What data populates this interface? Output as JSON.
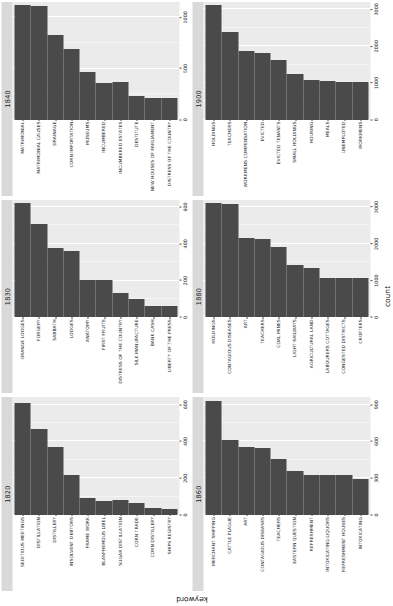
{
  "chart_data": {
    "type": "bar",
    "title": "",
    "xlabel": "count",
    "ylabel": "keyword",
    "orientation": "horizontal",
    "grid": true,
    "legend": false,
    "facet_variable": "decade",
    "panels": [
      {
        "facet_label": "1820",
        "xlim": [
          0,
          640
        ],
        "xticks": [
          0,
          200,
          400,
          600
        ],
        "xticklabels": [
          "0",
          "200",
          "400",
          "600"
        ],
        "categories": [
          "SEDITIOUS MEETINGS",
          "DISTILLATION",
          "DISTILLERY",
          "INSOLVENT DEBTORS",
          "FRAME WORK",
          "BLASPHEMOUS LIBEL",
          "SUGAR DISTILLATION",
          "CORN TRADE",
          "CORN DISTILLERY",
          "SHIPS REGISTRY"
        ],
        "values": [
          610,
          470,
          370,
          215,
          95,
          78,
          80,
          63,
          40,
          35
        ]
      },
      {
        "facet_label": "1830",
        "xlim": [
          0,
          640
        ],
        "xticks": [
          0,
          200,
          400,
          600
        ],
        "xticklabels": [
          "0",
          "200",
          "400",
          "600"
        ],
        "categories": [
          "ORANGE LODGES",
          "FORGERY",
          "SABBATH",
          "LODGES",
          "ANATOMY",
          "FIRST FRUITS",
          "DISTRESS OF THE COUNTRY",
          "SILK MANUFACTURE",
          "BANK CASH",
          "LIBERTY OF THE PRESS"
        ],
        "values": [
          620,
          505,
          375,
          360,
          205,
          205,
          130,
          100,
          62,
          60
        ]
      },
      {
        "facet_label": "1840",
        "xlim": [
          0,
          1150
        ],
        "xticks": [
          0,
          500,
          1000
        ],
        "xticklabels": [
          "0",
          "500",
          "1000"
        ],
        "categories": [
          "MATRIMONIAL",
          "MATRIMONIAL CAUSES",
          "DRAINAGE",
          "CORN IMPORTATION",
          "MUSEUMS",
          "INCUMBERED",
          "INCUMBERED ESTATES",
          "DESTITUTE",
          "NEW HOUSES OF PARLIAMENT",
          "DISTRESS OF THE COUNTRY"
        ],
        "values": [
          1120,
          1115,
          830,
          690,
          470,
          360,
          365,
          235,
          215,
          210
        ]
      },
      {
        "facet_label": "1860",
        "xlim": [
          0,
          960
        ],
        "xticks": [
          0,
          300,
          600,
          900
        ],
        "xticklabels": [
          "0",
          "300",
          "600",
          "900"
        ],
        "categories": [
          "MERCHANT SHIPPING",
          "CATTLE PLAGUE",
          "ART",
          "CONTAGIOUS DISEASES",
          "TEACHERS",
          "EASTERN QUESTION",
          "REFRESHMENT",
          "INTOXICATING LIQUORS",
          "REFRESHMENT HOUSES",
          "INTOXICATING"
        ],
        "values": [
          930,
          610,
          555,
          550,
          455,
          355,
          330,
          330,
          330,
          290
        ]
      },
      {
        "facet_label": "1880",
        "xlim": [
          0,
          3200
        ],
        "xticks": [
          0,
          1000,
          2000,
          3000
        ],
        "xticklabels": [
          "0",
          "1000",
          "2000",
          "3000"
        ],
        "categories": [
          "HOLDINGS",
          "CONTAGIOUS DISEASES",
          "ART",
          "TEACHERS",
          "COAL MINES",
          "LIGHT RAILWAYS",
          "AGRICULTURAL LAND",
          "LABOURERS COTTAGES",
          "CONGESTED DISTRICTS",
          "CROFTERS"
        ],
        "values": [
          3100,
          3090,
          2170,
          2130,
          1900,
          1430,
          1330,
          1080,
          1070,
          1060
        ]
      },
      {
        "facet_label": "1900",
        "xlim": [
          0,
          3200
        ],
        "xticks": [
          0,
          1000,
          2000,
          3000
        ],
        "xticklabels": [
          "0",
          "1000",
          "2000",
          "3000"
        ],
        "categories": [
          "HOLDINGS",
          "TEACHERS",
          "WORKMENS COMPENSATION",
          "EVICTED",
          "EVICTED TENANTS",
          "SMALL HOLDINGS",
          "HOUSING",
          "MEALS",
          "UNEMPLOYED",
          "WORKMENS"
        ],
        "values": [
          3120,
          2390,
          1880,
          1810,
          1610,
          1230,
          1080,
          1060,
          1035,
          1030
        ]
      }
    ],
    "colors": {
      "bar": "#4a4a4a",
      "panel_background": "#ebebeb",
      "strip_background": "#d9d9d9",
      "gridline": "#ffffff",
      "text": "#1a1a1a"
    }
  }
}
